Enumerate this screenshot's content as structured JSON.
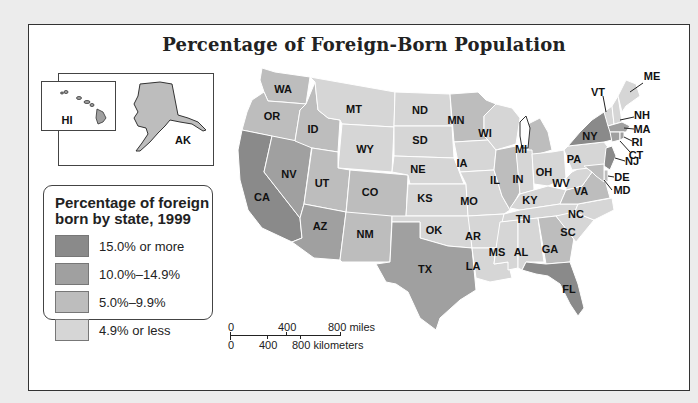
{
  "map": {
    "title": "Percentage of Foreign-Born Population",
    "colors": {
      "tier1": "#8a8a8a",
      "tier2": "#a0a0a0",
      "tier3": "#bdbdbd",
      "tier4": "#d6d6d6",
      "border": "#ffffff",
      "coast": "#333333"
    },
    "legend": {
      "title_line1": "Percentage of foreign",
      "title_line2": "born by state, 1999",
      "items": [
        {
          "label": "15.0% or more",
          "tier": "tier1"
        },
        {
          "label": "10.0%–14.9%",
          "tier": "tier2"
        },
        {
          "label": "5.0%–9.9%",
          "tier": "tier3"
        },
        {
          "label": "4.9% or less",
          "tier": "tier4"
        }
      ]
    },
    "insets": {
      "hawaii": {
        "label": "HI",
        "tier": "tier2"
      },
      "alaska": {
        "label": "AK",
        "tier": "tier3"
      }
    },
    "scale": {
      "miles": {
        "zero": "0",
        "mid": "400",
        "end": "800 miles"
      },
      "km": {
        "zero": "0",
        "mid": "400",
        "end": "800 kilometers"
      }
    },
    "states": {
      "WA": "tier3",
      "OR": "tier3",
      "CA": "tier1",
      "NV": "tier2",
      "ID": "tier3",
      "MT": "tier4",
      "WY": "tier4",
      "UT": "tier3",
      "AZ": "tier2",
      "CO": "tier3",
      "NM": "tier3",
      "ND": "tier4",
      "SD": "tier4",
      "NE": "tier4",
      "KS": "tier4",
      "OK": "tier4",
      "TX": "tier2",
      "MN": "tier3",
      "IA": "tier4",
      "MO": "tier4",
      "AR": "tier4",
      "LA": "tier4",
      "WI": "tier4",
      "IL": "tier3",
      "MI": "tier3",
      "IN": "tier4",
      "OH": "tier4",
      "KY": "tier4",
      "TN": "tier4",
      "MS": "tier4",
      "AL": "tier4",
      "GA": "tier3",
      "FL": "tier1",
      "SC": "tier4",
      "NC": "tier4",
      "VA": "tier3",
      "WV": "tier4",
      "PA": "tier4",
      "NY": "tier1",
      "VT": "tier4",
      "NH": "tier4",
      "ME": "tier4",
      "MA": "tier2",
      "RI": "tier2",
      "CT": "tier2",
      "NJ": "tier1",
      "DE": "tier3",
      "MD": "tier3"
    },
    "callout_labels": [
      "ME",
      "VT",
      "NH",
      "MA",
      "RI",
      "CT",
      "NJ",
      "DE",
      "MD"
    ]
  }
}
